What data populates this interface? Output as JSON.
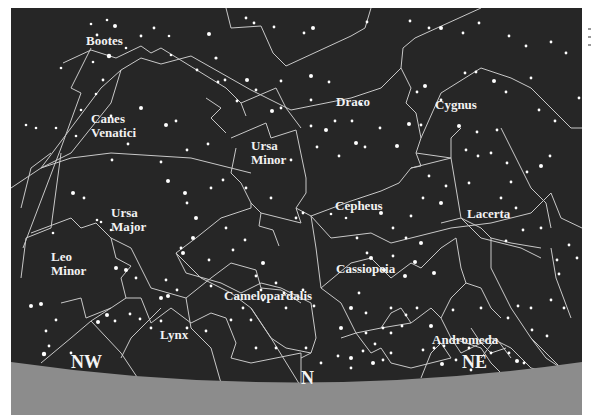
{
  "figure": {
    "type": "star-chart",
    "view": "northern sky, facing north",
    "colors": {
      "sky": "#262626",
      "ground": "#8c8c8c",
      "lines": "#c8c8c8",
      "stars": "#ffffff",
      "labels": "#f2f2f2"
    }
  },
  "constellations": [
    {
      "id": "bootes",
      "label": "Bootes"
    },
    {
      "id": "canes-venatici",
      "label": "Canes\nVenatici",
      "lines": [
        "Canes",
        "Venatici"
      ]
    },
    {
      "id": "draco",
      "label": "Draco"
    },
    {
      "id": "cygnus",
      "label": "Cygnus"
    },
    {
      "id": "ursa-minor",
      "lines": [
        "Ursa",
        "Minor"
      ]
    },
    {
      "id": "cepheus",
      "label": "Cepheus"
    },
    {
      "id": "lacerta",
      "label": "Lacerta"
    },
    {
      "id": "ursa-major",
      "lines": [
        "Ursa",
        "Major"
      ]
    },
    {
      "id": "leo-minor",
      "lines": [
        "Leo",
        "Minor"
      ]
    },
    {
      "id": "cassiopeia",
      "label": "Cassiopeia"
    },
    {
      "id": "camelopardalis",
      "label": "Camelopardalis"
    },
    {
      "id": "lynx",
      "label": "Lynx"
    },
    {
      "id": "andromeda",
      "label": "Andromeda"
    }
  ],
  "directions": {
    "nw": "NW",
    "n": "N",
    "ne": "NE"
  }
}
